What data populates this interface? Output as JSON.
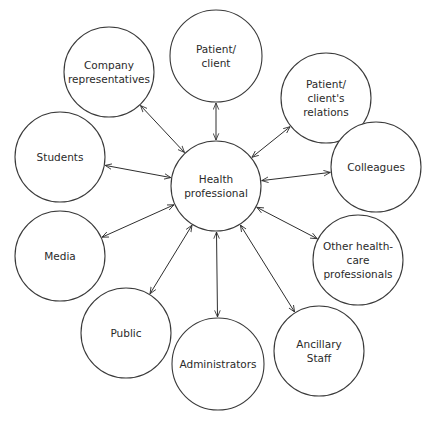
{
  "diagram": {
    "type": "hub-and-spoke",
    "center": {
      "id": "health-professional",
      "label": [
        "Health",
        "professional"
      ],
      "x": 216,
      "y": 186,
      "r": 45
    },
    "nodes": [
      {
        "id": "patient-client",
        "label": [
          "Patient/",
          "client"
        ],
        "x": 216,
        "y": 56,
        "r": 46
      },
      {
        "id": "company-representatives",
        "label": [
          "Company",
          "representatives"
        ],
        "x": 109,
        "y": 72,
        "r": 45
      },
      {
        "id": "patient-clients-relations",
        "label": [
          "Patient/",
          "client's",
          "relations"
        ],
        "x": 326,
        "y": 98,
        "r": 45
      },
      {
        "id": "students",
        "label": [
          "Students"
        ],
        "x": 60,
        "y": 157,
        "r": 45
      },
      {
        "id": "colleagues",
        "label": [
          "Colleagues"
        ],
        "x": 376,
        "y": 167,
        "r": 45
      },
      {
        "id": "media",
        "label": [
          "Media"
        ],
        "x": 60,
        "y": 256,
        "r": 45
      },
      {
        "id": "other-health-care-professionals",
        "label": [
          "Other health-",
          "care",
          "professionals"
        ],
        "x": 358,
        "y": 260,
        "r": 45
      },
      {
        "id": "public",
        "label": [
          "Public"
        ],
        "x": 126,
        "y": 333,
        "r": 45
      },
      {
        "id": "administrators",
        "label": [
          "Administrators"
        ],
        "x": 218,
        "y": 364,
        "r": 46
      },
      {
        "id": "ancillary-staff",
        "label": [
          "Ancillary",
          "Staff"
        ],
        "x": 319,
        "y": 351,
        "r": 45
      }
    ],
    "edges": "bidirectional arrows between center and every node",
    "colors": {
      "stroke": "#3a3a3a",
      "text": "#2a2a2a",
      "background": "#ffffff"
    }
  }
}
